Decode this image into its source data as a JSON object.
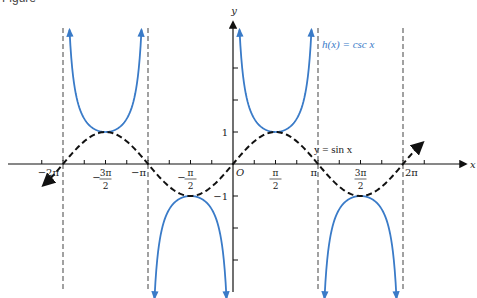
{
  "figure_label": "Figure",
  "chart_data": {
    "type": "line",
    "title": "",
    "xlabel": "x",
    "ylabel": "y",
    "origin_label": "O",
    "xlim_rad": [
      -8.3,
      8.55
    ],
    "ylim": [
      -3.9,
      4.5
    ],
    "grid": false,
    "legend_position": "inline annotations",
    "x_ticks_every": "pi/4",
    "x_tick_labels": [
      {
        "value": "-2pi",
        "label": "−2π"
      },
      {
        "value": "-3pi/2",
        "num": "3π",
        "den": "2",
        "sign": "−"
      },
      {
        "value": "-pi",
        "label": "−π"
      },
      {
        "value": "-pi/2",
        "num": "π",
        "den": "2",
        "sign": "−"
      },
      {
        "value": "pi/2",
        "num": "π",
        "den": "2",
        "sign": ""
      },
      {
        "value": "pi",
        "label": "π"
      },
      {
        "value": "3pi/2",
        "num": "3π",
        "den": "2",
        "sign": ""
      },
      {
        "value": "2pi",
        "label": "2π"
      }
    ],
    "y_tick_labels": [
      {
        "value": 1,
        "label": "1"
      },
      {
        "value": -1,
        "label": "−1"
      }
    ],
    "y_ticks": [
      -3,
      -2,
      -1,
      1,
      2,
      3
    ],
    "asymptotes_x": [
      "-2pi",
      "-pi",
      "0",
      "pi",
      "2pi"
    ],
    "series": [
      {
        "name": "h(x) = csc x",
        "label": "h(x) = csc x",
        "style": "solid",
        "color": "#3a7bc8",
        "branches": [
          {
            "interval": "(-2pi, -pi)",
            "extremum": {
              "x": "-3pi/2",
              "y": 1
            }
          },
          {
            "interval": "(-pi, 0)",
            "extremum": {
              "x": "-pi/2",
              "y": -1
            }
          },
          {
            "interval": "(0, pi)",
            "extremum": {
              "x": "pi/2",
              "y": 1
            }
          },
          {
            "interval": "(pi, 2pi)",
            "extremum": {
              "x": "3pi/2",
              "y": -1
            }
          }
        ]
      },
      {
        "name": "y = sin x",
        "label": "y = sin x",
        "style": "dashed",
        "color": "#111111",
        "domain": "[-2pi - 0.7, 2pi + 0.7]",
        "key_points": [
          {
            "x": "-2pi",
            "y": 0
          },
          {
            "x": "-3pi/2",
            "y": 1
          },
          {
            "x": "-pi",
            "y": 0
          },
          {
            "x": "-pi/2",
            "y": -1
          },
          {
            "x": "0",
            "y": 0
          },
          {
            "x": "pi/2",
            "y": 1
          },
          {
            "x": "pi",
            "y": 0
          },
          {
            "x": "3pi/2",
            "y": -1
          },
          {
            "x": "2pi",
            "y": 0
          }
        ]
      }
    ]
  }
}
